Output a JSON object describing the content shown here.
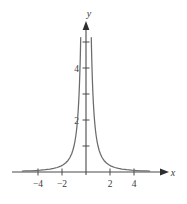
{
  "chart_data": {
    "type": "line",
    "title": "",
    "subtitle": "",
    "xlabel": "x",
    "ylabel": "y",
    "function": "y = 1/x^2",
    "xlim": [
      -5.4,
      5.4
    ],
    "ylim": [
      -0.35,
      5.6
    ],
    "grid": false,
    "legend": null,
    "x_ticks": [
      -4,
      -2,
      2,
      4
    ],
    "x_tick_labels": [
      "−4",
      "−2",
      "2",
      "4"
    ],
    "x_minor_ticks": [],
    "y_ticks": [
      1,
      2,
      3,
      4,
      5
    ],
    "y_tick_labels": [
      "",
      "2",
      "",
      "4",
      ""
    ],
    "series": [
      {
        "name": "y = 1/x^2 (left branch)",
        "x": [
          -5.3,
          -5.0,
          -4.6,
          -4.2,
          -3.8,
          -3.4,
          -3.0,
          -2.7,
          -2.4,
          -2.1,
          -1.9,
          -1.7,
          -1.5,
          -1.35,
          -1.2,
          -1.1,
          -1.0,
          -0.92,
          -0.85,
          -0.78,
          -0.72,
          -0.66,
          -0.61,
          -0.57,
          -0.53,
          -0.49,
          -0.46,
          -0.44
        ],
        "y": [
          0.036,
          0.04,
          0.047,
          0.057,
          0.069,
          0.087,
          0.111,
          0.137,
          0.174,
          0.227,
          0.277,
          0.346,
          0.444,
          0.549,
          0.694,
          0.826,
          1.0,
          1.182,
          1.384,
          1.644,
          1.929,
          2.296,
          2.687,
          3.078,
          3.56,
          4.165,
          4.726,
          5.165
        ]
      },
      {
        "name": "y = 1/x^2 (right branch)",
        "x": [
          0.44,
          0.46,
          0.49,
          0.53,
          0.57,
          0.61,
          0.66,
          0.72,
          0.78,
          0.85,
          0.92,
          1.0,
          1.1,
          1.2,
          1.35,
          1.5,
          1.7,
          1.9,
          2.1,
          2.4,
          2.7,
          3.0,
          3.4,
          3.8,
          4.2,
          4.6,
          5.0,
          5.3
        ],
        "y": [
          5.165,
          4.726,
          4.165,
          3.56,
          3.078,
          2.687,
          2.296,
          1.929,
          1.644,
          1.384,
          1.182,
          1.0,
          0.826,
          0.694,
          0.549,
          0.444,
          0.346,
          0.277,
          0.227,
          0.174,
          0.137,
          0.111,
          0.087,
          0.069,
          0.057,
          0.047,
          0.04,
          0.036
        ]
      }
    ],
    "colors": {
      "curve": "#6b6b6b",
      "axis": "#4a4a4a",
      "tick_label": "#3a3a3a"
    }
  },
  "axes": {
    "x_axis_label": "x",
    "y_axis_label": "y",
    "x_arrow": true,
    "y_arrow": true
  },
  "x_tick_items": [
    {
      "value": -4,
      "label": "−4"
    },
    {
      "value": -2,
      "label": "−2"
    },
    {
      "value": 2,
      "label": "2"
    },
    {
      "value": 4,
      "label": "4"
    }
  ],
  "y_tick_items": [
    {
      "value": 2,
      "label": "2"
    },
    {
      "value": 4,
      "label": "4"
    }
  ]
}
